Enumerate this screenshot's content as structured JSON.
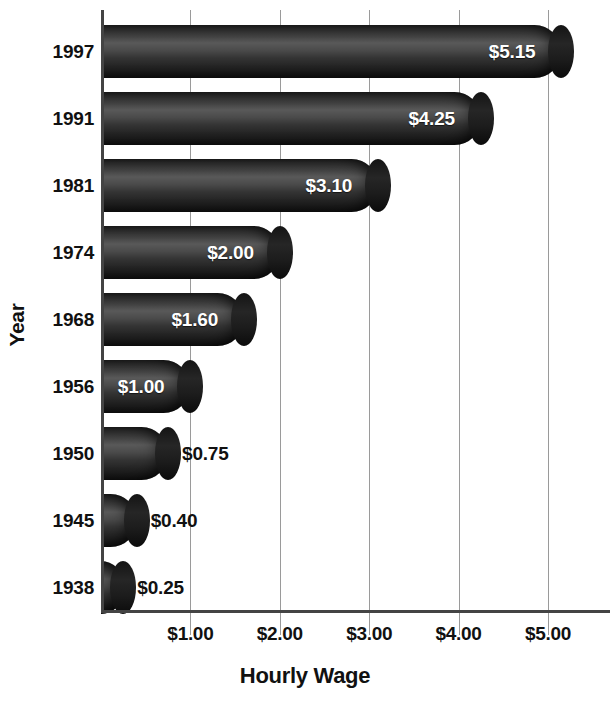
{
  "chart_data": {
    "type": "bar",
    "orientation": "horizontal",
    "title": "",
    "xlabel": "Hourly Wage",
    "ylabel": "Year",
    "categories": [
      "1997",
      "1991",
      "1981",
      "1974",
      "1968",
      "1956",
      "1950",
      "1945",
      "1938"
    ],
    "values": [
      5.15,
      4.25,
      3.1,
      2.0,
      1.6,
      1.0,
      0.75,
      0.4,
      0.25
    ],
    "value_labels": [
      "$5.15",
      "$4.25",
      "$3.10",
      "$2.00",
      "$1.60",
      "$1.00",
      "$0.75",
      "$0.40",
      "$0.25"
    ],
    "label_placement": [
      "inside",
      "inside",
      "inside",
      "inside",
      "inside",
      "inside",
      "outside",
      "outside",
      "outside"
    ],
    "xlim": [
      0,
      5.7
    ],
    "xticks": [
      1,
      2,
      3,
      4,
      5
    ],
    "xtick_labels": [
      "$1.00",
      "$2.00",
      "$3.00",
      "$4.00",
      "$5.00"
    ],
    "grid": "vertical",
    "legend": "none",
    "bar_color": "#2b2b2b",
    "bar_style": "cylinder-3d",
    "background_color": "#ffffff",
    "axis_color": "#444444",
    "gridline_color": "#9a9a9a",
    "text_color": "#111111",
    "inside_label_color": "#ffffff"
  },
  "axes": {
    "y_title": "Year",
    "x_title": "Hourly Wage"
  }
}
